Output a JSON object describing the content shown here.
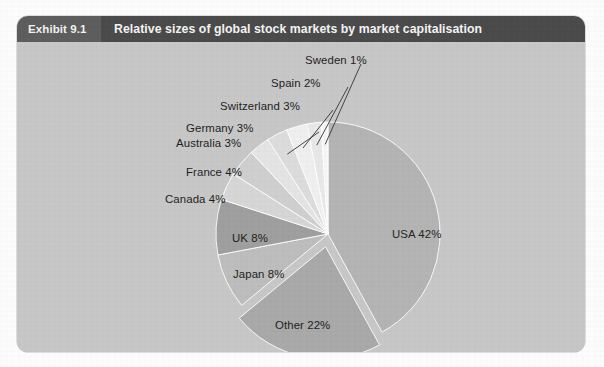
{
  "exhibit": {
    "tag": "Exhibit 9.1",
    "title": "Relative sizes of global stock markets by market capitalisation"
  },
  "chart_data": {
    "type": "pie",
    "title": "Relative sizes of global stock markets by market capitalisation",
    "unit": "%",
    "legend": "none",
    "labels_position": "outside-with-leader-lines",
    "exploded_slices": [
      "Other"
    ],
    "categories": [
      "USA",
      "Other",
      "Japan",
      "UK",
      "Canada",
      "France",
      "Australia",
      "Germany",
      "Switzerland",
      "Spain",
      "Sweden"
    ],
    "values": [
      42,
      22,
      8,
      8,
      4,
      4,
      3,
      3,
      3,
      2,
      1
    ],
    "slices": [
      {
        "name": "USA",
        "value": 42,
        "label": "USA 42%",
        "color": "#b4b4b4"
      },
      {
        "name": "Other",
        "value": 22,
        "label": "Other 22%",
        "color": "#a9a9a9"
      },
      {
        "name": "Japan",
        "value": 8,
        "label": "Japan 8%",
        "color": "#bdbdbd"
      },
      {
        "name": "UK",
        "value": 8,
        "label": "UK 8%",
        "color": "#9f9f9f"
      },
      {
        "name": "Canada",
        "value": 4,
        "label": "Canada 4%",
        "color": "#d6d6d6"
      },
      {
        "name": "France",
        "value": 4,
        "label": "France 4%",
        "color": "#cfcfcf"
      },
      {
        "name": "Australia",
        "value": 3,
        "label": "Australia 3%",
        "color": "#e4e4e4"
      },
      {
        "name": "Germany",
        "value": 3,
        "label": "Germany 3%",
        "color": "#dcdcdc"
      },
      {
        "name": "Switzerland",
        "value": 3,
        "label": "Switzerland 3%",
        "color": "#efefef"
      },
      {
        "name": "Spain",
        "value": 2,
        "label": "Spain 2%",
        "color": "#e8e8e8"
      },
      {
        "name": "Sweden",
        "value": 1,
        "label": "Sweden 1%",
        "color": "#f6f6f6"
      }
    ]
  },
  "colors": {
    "panel_background": "#c7c7c7",
    "header_tag_background": "#5d5d5d",
    "header_title_background": "#4a4a4a",
    "header_text": "#f2f2f2",
    "label_text": "#1d1d1d"
  }
}
